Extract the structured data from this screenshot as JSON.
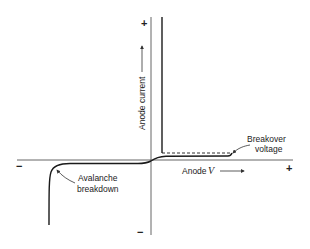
{
  "diagram": {
    "type": "thyristor-iv-characteristic",
    "axes": {
      "x_label_prefix": "Anode",
      "x_label_var": "V",
      "y_label": "Anode current",
      "x_positive": "+",
      "x_negative": "−",
      "y_positive": "+",
      "y_negative": "−"
    },
    "annotations": {
      "breakover_line1": "Breakover",
      "breakover_line2": "voltage",
      "avalanche_line1": "Avalanche",
      "avalanche_line2": "breakdown"
    },
    "colors": {
      "stroke": "#1a1a1a",
      "axis": "#555555"
    }
  }
}
